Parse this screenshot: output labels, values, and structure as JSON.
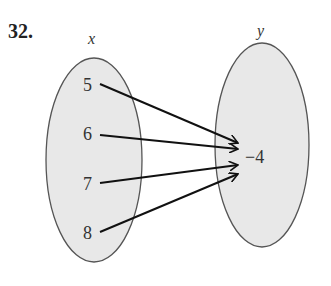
{
  "problem_number": "32.",
  "domain_label": "x",
  "range_label": "y",
  "domain_values": [
    "5",
    "6",
    "7",
    "8"
  ],
  "range_values": [
    "−4"
  ],
  "mapping": [
    {
      "from": "5",
      "to": "−4"
    },
    {
      "from": "6",
      "to": "−4"
    },
    {
      "from": "7",
      "to": "−4"
    },
    {
      "from": "8",
      "to": "−4"
    }
  ],
  "colors": {
    "ellipse_fill": "#e8e8e8",
    "ellipse_stroke": "#555555",
    "arrow": "#111111",
    "text": "#333333"
  }
}
